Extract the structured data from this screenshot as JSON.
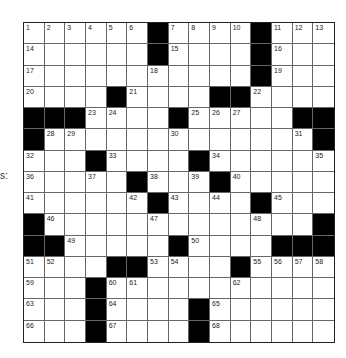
{
  "side_label": "s:",
  "puzzle": {
    "rows": 15,
    "cols": 15,
    "grid": [
      [
        "1",
        "2",
        "3",
        "4",
        "5",
        "6",
        "#",
        "7",
        "8",
        "9",
        "10",
        "#",
        "11",
        "12",
        "13"
      ],
      [
        "14",
        ".",
        ".",
        ".",
        ".",
        ".",
        "#",
        "15",
        ".",
        ".",
        ".",
        "#",
        "16",
        ".",
        "."
      ],
      [
        "17",
        ".",
        ".",
        ".",
        ".",
        ".",
        "18",
        ".",
        ".",
        ".",
        ".",
        "#",
        "19",
        ".",
        "."
      ],
      [
        "20",
        ".",
        ".",
        ".",
        "#",
        "21",
        ".",
        ".",
        ".",
        "#",
        "#",
        "22",
        ".",
        ".",
        "."
      ],
      [
        "#",
        "#",
        "#",
        "23",
        "24",
        ".",
        ".",
        "#",
        "25",
        "26",
        "27",
        ".",
        ".",
        "#",
        "#"
      ],
      [
        "#",
        "28",
        "29",
        ".",
        ".",
        ".",
        ".",
        "30",
        ".",
        ".",
        ".",
        ".",
        ".",
        "31",
        "#"
      ],
      [
        "32",
        ".",
        ".",
        "#",
        "33",
        ".",
        ".",
        ".",
        "#",
        "34",
        ".",
        ".",
        ".",
        ".",
        "35"
      ],
      [
        "36",
        ".",
        ".",
        "37",
        ".",
        "#",
        "38",
        ".",
        "39",
        "#",
        "40",
        ".",
        ".",
        ".",
        "."
      ],
      [
        "41",
        ".",
        ".",
        ".",
        ".",
        "42",
        "#",
        "43",
        ".",
        "44",
        ".",
        "#",
        "45",
        ".",
        "."
      ],
      [
        "#",
        "46",
        ".",
        ".",
        ".",
        ".",
        "47",
        ".",
        ".",
        ".",
        ".",
        "48",
        ".",
        ".",
        "#"
      ],
      [
        "#",
        "#",
        "49",
        ".",
        ".",
        ".",
        ".",
        "#",
        "50",
        ".",
        ".",
        ".",
        "#",
        "#",
        "#"
      ],
      [
        "51",
        "52",
        ".",
        ".",
        "#",
        "#",
        "53",
        "54",
        ".",
        ".",
        "#",
        "55",
        "56",
        "57",
        "58"
      ],
      [
        "59",
        ".",
        ".",
        "#",
        "60",
        "61",
        ".",
        ".",
        ".",
        ".",
        "62",
        ".",
        ".",
        ".",
        "."
      ],
      [
        "63",
        ".",
        ".",
        "#",
        "64",
        ".",
        ".",
        ".",
        "#",
        "65",
        ".",
        ".",
        ".",
        ".",
        "."
      ],
      [
        "66",
        ".",
        ".",
        "#",
        "67",
        ".",
        ".",
        ".",
        "#",
        "68",
        ".",
        ".",
        ".",
        ".",
        "."
      ]
    ],
    "colors": {
      "block": "#000000",
      "cell": "#ffffff",
      "line": "#666666"
    }
  }
}
